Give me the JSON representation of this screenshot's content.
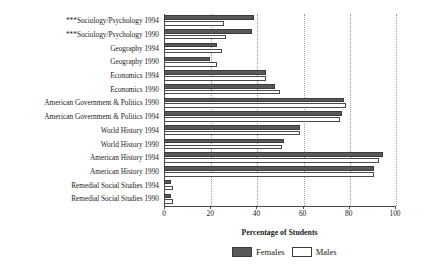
{
  "chart_data": {
    "type": "bar",
    "orientation": "horizontal",
    "title": "",
    "xlabel": "Percentage of Students",
    "ylabel": "",
    "xlim": [
      0,
      100
    ],
    "xticks": [
      0,
      20,
      40,
      60,
      80,
      100
    ],
    "grid": true,
    "legend_position": "bottom-right",
    "categories": [
      "***Sociology/Psychology 1994",
      "***Sociology/Psychology 1990",
      "Geography 1994",
      "Geography 1990",
      "Economics 1994",
      "Economics 1990",
      "American Government & Politics 1990",
      "American Government & Politics 1994",
      "World History 1994",
      "World History 1990",
      "American History 1994",
      "American History 1990",
      "Remedial Social Studies 1994",
      "Remedial Social Studies 1990"
    ],
    "series": [
      {
        "name": "Females",
        "color": "#595959",
        "values": [
          39,
          38,
          23,
          20,
          44,
          48,
          78,
          77,
          59,
          52,
          95,
          91,
          3,
          3
        ]
      },
      {
        "name": "Males",
        "color": "#ffffff",
        "values": [
          26,
          27,
          25,
          23,
          44,
          50,
          79,
          76,
          59,
          51,
          93,
          91,
          4,
          4
        ]
      }
    ]
  },
  "legend": {
    "items": [
      {
        "label": "Females",
        "swatch": "filled-dark"
      },
      {
        "label": "Males",
        "swatch": "empty-white"
      }
    ]
  },
  "axis": {
    "x_title": "Percentage of Students",
    "tick_labels": [
      "0",
      "20",
      "40",
      "60",
      "80",
      "100"
    ]
  }
}
